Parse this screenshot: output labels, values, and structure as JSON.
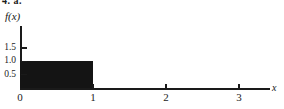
{
  "header": {
    "label": "4. a."
  },
  "axes": {
    "y_axis_label": "f(x)",
    "x_axis_label": "x",
    "y_ticks": [
      {
        "label": "1.5",
        "value": 1.5
      },
      {
        "label": "1.0",
        "value": 1.0
      },
      {
        "label": "0.5",
        "value": 0.5
      }
    ],
    "x_ticks": [
      {
        "label": "0",
        "value": 0
      },
      {
        "label": "1",
        "value": 1
      },
      {
        "label": "2",
        "value": 2
      },
      {
        "label": "3",
        "value": 3
      }
    ]
  },
  "chart_data": {
    "type": "bar",
    "title": "",
    "subtitle": "",
    "xlabel": "x",
    "ylabel": "f(x)",
    "xlim": [
      0,
      3.45
    ],
    "ylim": [
      0,
      1.75
    ],
    "grid": false,
    "legend": null,
    "xticks": [
      0,
      1,
      2,
      3
    ],
    "xticklabels": [
      "0",
      "1",
      "2",
      "3"
    ],
    "yticks": [
      0.5,
      1.0,
      1.5
    ],
    "yticklabels": [
      "0.5",
      "1.0",
      "1.5"
    ],
    "series": [
      {
        "name": "uniform density",
        "kind": "step-block",
        "color": "#141414",
        "fill": "solid",
        "x_start": 0,
        "x_end": 1,
        "height": 1.0
      }
    ],
    "annotations": []
  },
  "colors": {
    "ink": "#1a1a1a",
    "block_fill": "#141414",
    "background": "#ffffff"
  }
}
